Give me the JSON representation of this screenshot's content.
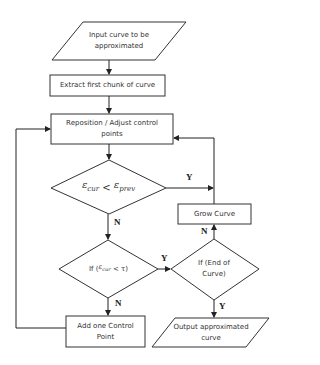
{
  "nodes": {
    "input": {
      "label": "Input curve to be approximated",
      "shape": "parallelogram"
    },
    "extract": {
      "label": "Extract first chunk of curve",
      "shape": "process"
    },
    "reposition": {
      "label": "Reposition / Adjust control points",
      "shape": "process"
    },
    "decision_error": {
      "label_lhs": "ε",
      "lhs_sub": "cur",
      "op": " < ",
      "label_rhs": "ε",
      "rhs_sub": "prev",
      "shape": "decision"
    },
    "grow": {
      "label": "Grow Curve",
      "shape": "process"
    },
    "decision_tau": {
      "prefix": "If (",
      "var": "ε",
      "var_sub": "cur",
      "op": " < τ)",
      "shape": "decision"
    },
    "decision_end": {
      "label": "If (End of Curve)",
      "shape": "decision"
    },
    "add": {
      "label": "Add one Control Point",
      "shape": "process"
    },
    "output": {
      "label": "Output approximated curve",
      "shape": "parallelogram"
    }
  },
  "edges": {
    "yes_label": "Y",
    "no_label": "N"
  },
  "colors": {
    "stroke": "#333333",
    "fill": "#ffffff"
  }
}
